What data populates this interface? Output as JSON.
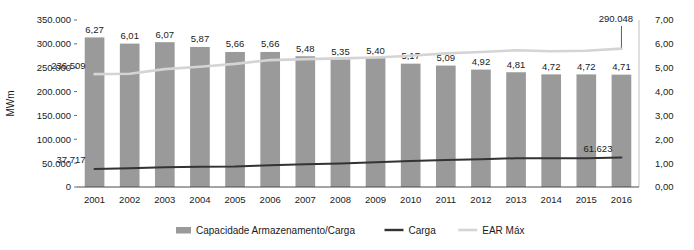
{
  "chart_data": {
    "type": "bar",
    "title": "",
    "subtitle": "",
    "xlabel": "",
    "ylabel": "MWm",
    "y2label": "",
    "grid": false,
    "legend_position": "bottom",
    "categories": [
      "2001",
      "2002",
      "2003",
      "2004",
      "2005",
      "2006",
      "2007",
      "2008",
      "2009",
      "2010",
      "2011",
      "2012",
      "2013",
      "2014",
      "2015",
      "2016"
    ],
    "ylim": [
      0,
      350000
    ],
    "y2lim": [
      0,
      7
    ],
    "ytick_labels": [
      "0",
      "50.000",
      "100.000",
      "150.000",
      "200.000",
      "250.000",
      "300.000",
      "350.000"
    ],
    "ytick_values": [
      0,
      50000,
      100000,
      150000,
      200000,
      250000,
      300000,
      350000
    ],
    "y2tick_labels": [
      "0,00",
      "1,00",
      "2,00",
      "3,00",
      "4,00",
      "5,00",
      "6,00",
      "7,00"
    ],
    "y2tick_values": [
      0,
      1,
      2,
      3,
      4,
      5,
      6,
      7
    ],
    "series": [
      {
        "name": "Capacidade Armazenamento/Carga",
        "type": "bar",
        "axis": "right",
        "color": "#9a9a9a",
        "values": [
          6.27,
          6.01,
          6.07,
          5.87,
          5.66,
          5.66,
          5.48,
          5.35,
          5.4,
          5.17,
          5.09,
          4.92,
          4.81,
          4.72,
          4.72,
          4.71
        ],
        "data_labels": [
          "6,27",
          "6,01",
          "6,07",
          "5,87",
          "5,66",
          "5,66",
          "5,48",
          "5,35",
          "5,40",
          "5,17",
          "5,09",
          "4,92",
          "4,81",
          "4,72",
          "4,72",
          "4,71"
        ]
      },
      {
        "name": "Carga",
        "type": "line",
        "axis": "left",
        "color": "#333333",
        "values": [
          37717,
          39500,
          41200,
          42400,
          43100,
          45500,
          47600,
          49200,
          51800,
          54300,
          56400,
          58100,
          60300,
          60100,
          60400,
          61623
        ]
      },
      {
        "name": "EAR Máx",
        "type": "line",
        "axis": "left",
        "color": "#d4d4d4",
        "values": [
          236509,
          237500,
          247000,
          252000,
          258000,
          266000,
          268000,
          269500,
          271500,
          275000,
          280000,
          283000,
          286500,
          284500,
          285500,
          290048
        ]
      }
    ],
    "annotations": [
      {
        "text": "236.509",
        "series": "EAR Máx",
        "category": "2001"
      },
      {
        "text": "290.048",
        "series": "EAR Máx",
        "category": "2016"
      },
      {
        "text": "37.717",
        "series": "Carga",
        "category": "2001"
      },
      {
        "text": "61.623",
        "series": "Carga",
        "category": "2016"
      }
    ],
    "legend": [
      {
        "label": "Capacidade Armazenamento/Carga",
        "marker": "bar",
        "color": "#9a9a9a"
      },
      {
        "label": "Carga",
        "marker": "line",
        "color": "#333333"
      },
      {
        "label": "EAR Máx",
        "marker": "line",
        "color": "#d4d4d4"
      }
    ]
  }
}
